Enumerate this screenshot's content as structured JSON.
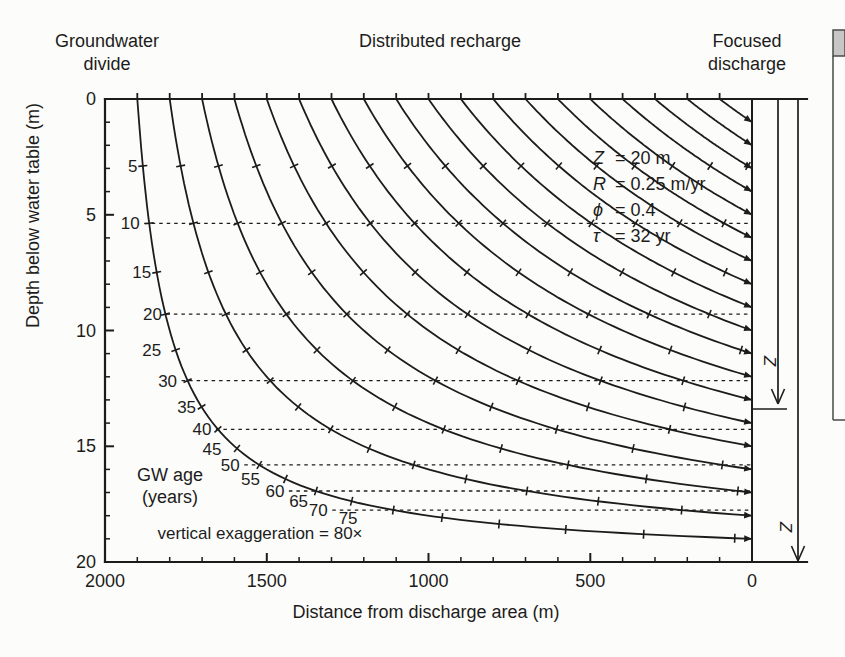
{
  "header": {
    "left_line1": "Groundwater",
    "left_line2": "divide",
    "center": "Distributed recharge",
    "right_line1": "Focused",
    "right_line2": "discharge"
  },
  "params": [
    {
      "symbol": "Z",
      "value": "= 20 m"
    },
    {
      "symbol": "R",
      "value": "= 0.25 m/yr"
    },
    {
      "symbol": "ϕ",
      "value": "= 0.4"
    },
    {
      "symbol": "τ",
      "value": "= 32 yr"
    }
  ],
  "annotations": {
    "gw_age_line1": "GW age",
    "gw_age_line2": "(years)",
    "vertical_exaggeration": "vertical exaggeration = 80×",
    "z_arrow_label": "Z"
  },
  "chart_data": {
    "type": "line",
    "xlabel": "Distance from discharge area (m)",
    "ylabel": "Depth below water table (m)",
    "xlim": [
      2000,
      0
    ],
    "ylim": [
      0,
      20
    ],
    "xticks": [
      2000,
      1500,
      1000,
      500,
      0
    ],
    "yticks": [
      0,
      5,
      10,
      15,
      20
    ],
    "x_minor_step_m": 100,
    "y_minor_step_m": 1,
    "model": {
      "Z_m": 20,
      "R_m_per_yr": 0.25,
      "phi": 0.4,
      "tau_yr": 32,
      "domain_length_m": 2000
    },
    "flowline_entry_distances_m": [
      1900,
      1800,
      1700,
      1600,
      1500,
      1400,
      1300,
      1200,
      1100,
      1000,
      900,
      800,
      700,
      600,
      500,
      400,
      300,
      200,
      100
    ],
    "flowline_age_tick_interval_yr": 5,
    "isochrone_ages_yr": [
      10,
      20,
      30,
      40,
      50,
      60,
      70
    ],
    "age_labels_yr": [
      5,
      10,
      15,
      20,
      25,
      30,
      35,
      40,
      45,
      50,
      55,
      60,
      65,
      70,
      75
    ],
    "age_depth_pairs": [
      {
        "age_yr": 5,
        "depth_m": 2.9
      },
      {
        "age_yr": 10,
        "depth_m": 5.4
      },
      {
        "age_yr": 15,
        "depth_m": 7.5
      },
      {
        "age_yr": 20,
        "depth_m": 9.3
      },
      {
        "age_yr": 25,
        "depth_m": 10.9
      },
      {
        "age_yr": 30,
        "depth_m": 12.3
      },
      {
        "age_yr": 35,
        "depth_m": 13.4
      },
      {
        "age_yr": 40,
        "depth_m": 14.4
      },
      {
        "age_yr": 45,
        "depth_m": 15.3
      },
      {
        "age_yr": 50,
        "depth_m": 16.0
      },
      {
        "age_yr": 55,
        "depth_m": 16.7
      },
      {
        "age_yr": 60,
        "depth_m": 17.2
      },
      {
        "age_yr": 65,
        "depth_m": 17.7
      },
      {
        "age_yr": 70,
        "depth_m": 18.1
      },
      {
        "age_yr": 75,
        "depth_m": 18.4
      }
    ],
    "legend_position": "none",
    "grid": false
  },
  "colors": {
    "ink": "#1c1c1c",
    "paper": "#fcfcfa",
    "cutoff_box_gray": "#c6c6c6",
    "cutoff_box_border": "#4a4a4a"
  }
}
